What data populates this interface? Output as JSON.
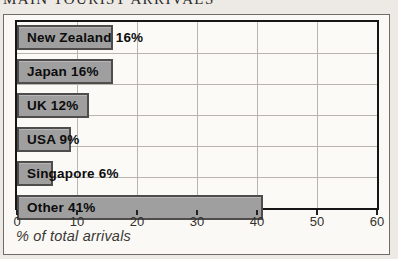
{
  "page_title": "MAIN TOURIST ARRIVALS",
  "chart_data": {
    "type": "bar",
    "orientation": "horizontal",
    "title": "MAIN TOURIST ARRIVALS",
    "categories": [
      "New Zealand",
      "Japan",
      "UK",
      "USA",
      "Singapore",
      "Other"
    ],
    "values": [
      16,
      16,
      12,
      9,
      6,
      41
    ],
    "bar_labels": [
      "New Zealand 16%",
      "Japan 16%",
      "UK 12%",
      "USA 9%",
      "Singapore 6%",
      "Other 41%"
    ],
    "xlabel": "% of total arrivals",
    "xlim": [
      0,
      60
    ],
    "x_ticks": [
      0,
      10,
      20,
      30,
      40,
      50,
      60
    ],
    "grid": true,
    "legend": "none",
    "bar_color": "#9f9f9f",
    "bar_border_color": "#4f4d4b",
    "plot_border_color": "#161616",
    "gridline_color": "#b9b5af",
    "panel_color": "#fbf9f5",
    "page_background_color": "#ede9e4"
  }
}
